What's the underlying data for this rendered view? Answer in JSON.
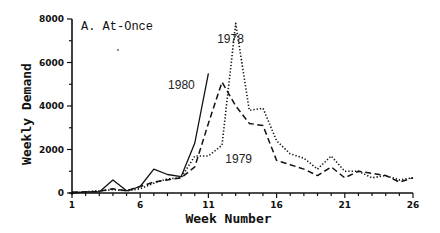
{
  "chart_data": {
    "type": "line",
    "title": "A. At-Once",
    "xlabel": "Week Number",
    "ylabel": "Weekly Demand",
    "xlim": [
      1,
      26
    ],
    "ylim": [
      0,
      8000
    ],
    "x_ticks": [
      1,
      6,
      11,
      16,
      21,
      26
    ],
    "y_ticks": [
      0,
      2000,
      4000,
      6000,
      8000
    ],
    "grid": false,
    "legend": "inline labels",
    "series": [
      {
        "name": "1980",
        "style": "solid",
        "x": [
          1,
          2,
          3,
          4,
          5,
          6,
          7,
          8,
          9,
          10,
          11
        ],
        "values": [
          0,
          50,
          50,
          600,
          100,
          300,
          1100,
          850,
          750,
          2300,
          5500
        ]
      },
      {
        "name": "1979",
        "style": "dashed",
        "x": [
          1,
          2,
          3,
          4,
          5,
          6,
          7,
          8,
          9,
          10,
          11,
          12,
          13,
          14,
          15,
          16,
          17,
          18,
          19,
          20,
          21,
          22,
          23,
          24,
          25,
          26
        ],
        "values": [
          50,
          50,
          80,
          200,
          100,
          300,
          500,
          600,
          700,
          1200,
          3200,
          5100,
          4000,
          3200,
          3100,
          1500,
          1300,
          1100,
          800,
          1200,
          700,
          1000,
          900,
          800,
          500,
          700
        ]
      },
      {
        "name": "1978",
        "style": "dotted",
        "x": [
          1,
          2,
          3,
          4,
          5,
          6,
          7,
          8,
          9,
          10,
          11,
          12,
          13,
          14,
          15,
          16,
          17,
          18,
          19,
          20,
          21,
          22,
          23,
          24,
          25,
          26
        ],
        "values": [
          0,
          50,
          100,
          150,
          100,
          200,
          450,
          650,
          700,
          1700,
          1700,
          2200,
          7800,
          3800,
          3900,
          2400,
          1800,
          1600,
          1100,
          1700,
          1000,
          1000,
          700,
          800,
          600,
          700
        ]
      }
    ],
    "annotations": [
      {
        "text": "1980",
        "x": 10.0,
        "y": 4800
      },
      {
        "text": "1978",
        "x": 13.6,
        "y": 6900
      },
      {
        "text": "1979",
        "x": 14.2,
        "y": 1400
      }
    ]
  }
}
